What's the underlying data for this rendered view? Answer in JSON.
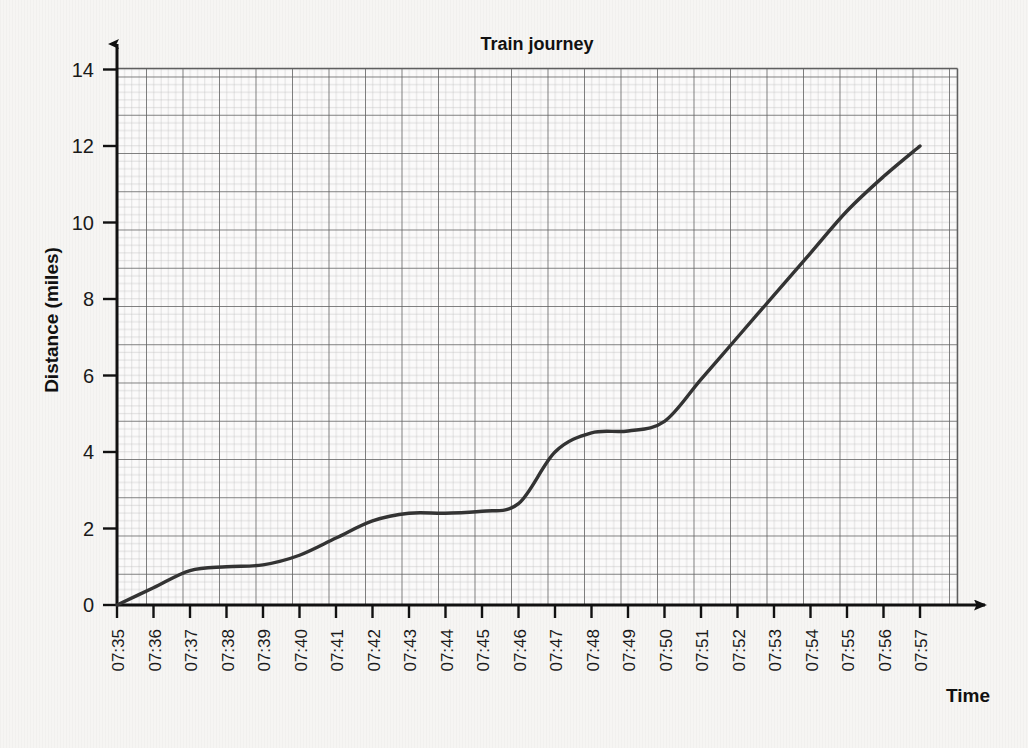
{
  "chart_data": {
    "type": "line",
    "title": "Train journey",
    "xlabel": "Time",
    "ylabel": "Distance (miles)",
    "xlim": [
      "07:35",
      "07:57"
    ],
    "ylim": [
      0,
      14
    ],
    "y_ticks": [
      0,
      2,
      4,
      6,
      8,
      10,
      12,
      14
    ],
    "y_tick_labels": [
      "0",
      "2",
      "4",
      "6",
      "8",
      "10",
      "12",
      "14"
    ],
    "y_minor_step": 1,
    "grid": "major and minor graph paper grid",
    "legend": "none",
    "x_tick_labels": [
      "07:35",
      "07:36",
      "07:37",
      "07:38",
      "07:39",
      "07:40",
      "07:41",
      "07:42",
      "07:43",
      "07:44",
      "07:45",
      "07:46",
      "07:47",
      "07:48",
      "07:49",
      "07:50",
      "07:51",
      "07:52",
      "07:53",
      "07:54",
      "07:55",
      "07:56",
      "07:57"
    ],
    "x_tick_rotation": -90,
    "series": [
      {
        "name": "Train distance travelled",
        "color": "#333333",
        "x": [
          "07:35",
          "07:36",
          "07:37",
          "07:38",
          "07:39",
          "07:40",
          "07:41",
          "07:42",
          "07:43",
          "07:44",
          "07:45",
          "07:46",
          "07:47",
          "07:48",
          "07:49",
          "07:50",
          "07:51",
          "07:52",
          "07:53",
          "07:54",
          "07:55",
          "07:56",
          "07:57"
        ],
        "values": [
          0,
          0.45,
          0.9,
          1.0,
          1.05,
          1.3,
          1.75,
          2.2,
          2.4,
          2.4,
          2.45,
          2.65,
          4.0,
          4.5,
          4.55,
          4.8,
          5.9,
          7.0,
          8.1,
          9.2,
          10.3,
          11.2,
          12.0
        ]
      }
    ],
    "annotations": [
      "Curve starts at 0 miles at 07:35",
      "First plateau about 1 mile between 07:37 and 07:39",
      "Second plateau about 2.4 miles between 07:42 and 07:45",
      "Third plateau about 4.5 miles between 07:47 and 07:50",
      "Straight steady climb from 07:50 to 12 miles at 07:57"
    ]
  },
  "colors": {
    "background": "#f6f5f3",
    "axis": "#111111",
    "grid_major": "#5f5f5f",
    "grid_minor": "#bdbdbd",
    "curve": "#333333",
    "text": "#1a1a1a"
  },
  "icons": {
    "y_axis_arrow": "arrow-up-icon",
    "x_axis_arrow": "arrow-right-icon"
  }
}
